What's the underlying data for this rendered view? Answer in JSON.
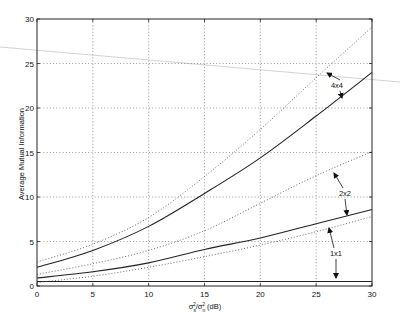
{
  "chart_data": {
    "type": "line",
    "title": "",
    "xlabel": "σs²/σn² (dB)",
    "xlabel_parts": {
      "sigma": "σ",
      "sub_s": "s",
      "sup_2": "2",
      "slash": "/",
      "sub_n": "n",
      "unit": " (dB)"
    },
    "ylabel": "Average Mutual Information",
    "xlim": [
      0,
      30
    ],
    "ylim": [
      0,
      30
    ],
    "grid": true,
    "x_ticks": [
      "0",
      "5",
      "10",
      "15",
      "20",
      "25",
      "30"
    ],
    "y_ticks": [
      "0",
      "5",
      "10",
      "15",
      "20",
      "25",
      "30"
    ],
    "x": [
      0,
      5,
      10,
      15,
      20,
      25,
      30
    ],
    "series": [
      {
        "name": "4x4",
        "style": "solid",
        "values": [
          2.1,
          4.0,
          6.7,
          10.4,
          14.4,
          19.1,
          24.0
        ]
      },
      {
        "name": "4x4 bound",
        "style": "dotted",
        "values": [
          2.7,
          4.7,
          7.7,
          12.3,
          17.6,
          23.4,
          29.1
        ]
      },
      {
        "name": "2x2",
        "style": "solid",
        "values": [
          0.9,
          1.6,
          2.6,
          4.1,
          5.4,
          7.0,
          8.6
        ]
      },
      {
        "name": "2x2 bound",
        "style": "dotted",
        "values": [
          1.3,
          2.5,
          4.0,
          6.2,
          9.3,
          12.4,
          15.1
        ]
      },
      {
        "name": "1x1",
        "style": "solid",
        "values": [
          0.5,
          0.5,
          0.5,
          0.5,
          0.5,
          0.5,
          0.5
        ]
      },
      {
        "name": "1x1 bound",
        "style": "dotted",
        "values": [
          0.4,
          1.1,
          2.1,
          3.3,
          4.6,
          6.1,
          7.8
        ]
      }
    ],
    "annotations": [
      {
        "text": "4x4",
        "x": 337,
        "y": 88,
        "arrows": [
          [
            340,
            80,
            327,
            73
          ],
          [
            340,
            91,
            342,
            98
          ]
        ]
      },
      {
        "text": "2x2",
        "x": 345,
        "y": 196,
        "arrows": [
          [
            343,
            188,
            334,
            173
          ],
          [
            345,
            199,
            347,
            215
          ]
        ]
      },
      {
        "text": "1x1",
        "x": 336,
        "y": 256,
        "arrows": [
          [
            334,
            248,
            329,
            228
          ],
          [
            336,
            259,
            336,
            278
          ]
        ]
      }
    ]
  },
  "plot_area": {
    "left": 37,
    "right": 372,
    "top": 19,
    "bottom": 286
  }
}
